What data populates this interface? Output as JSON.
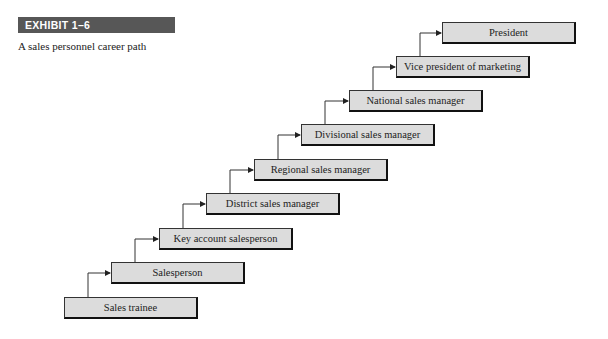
{
  "exhibit": {
    "label": "EXHIBIT 1–6",
    "caption": "A sales personnel career path"
  },
  "career_path": {
    "steps": [
      {
        "label": "Sales trainee"
      },
      {
        "label": "Salesperson"
      },
      {
        "label": "Key account salesperson"
      },
      {
        "label": "District sales manager"
      },
      {
        "label": "Regional sales manager"
      },
      {
        "label": "Divisional sales manager"
      },
      {
        "label": "National sales manager"
      },
      {
        "label": "Vice president of marketing"
      },
      {
        "label": "President"
      }
    ]
  },
  "colors": {
    "header_bg": "#575757",
    "box_fill": "#dcdcdc",
    "box_border": "#111111"
  }
}
